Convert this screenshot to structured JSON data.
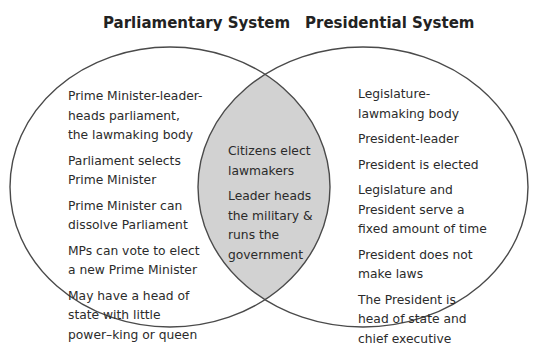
{
  "diagram": {
    "type": "venn",
    "colors": {
      "outline": "#4a4a4a",
      "intersection_fill": "#d2d2d2",
      "background": "#ffffff",
      "text": "#2b2b2b"
    },
    "left": {
      "title": "Parliamentary System",
      "items": [
        "Prime Minister-leader-heads parliament, the lawmaking body",
        "Parliament selects Prime Minister",
        "Prime Minister can dissolve Parliament",
        "MPs can vote to elect a new Prime Minister",
        "May have a head of state with little power–king or queen"
      ]
    },
    "center": {
      "items": [
        "Citizens elect lawmakers",
        "Leader heads the military & runs the government"
      ]
    },
    "right": {
      "title": "Presidential System",
      "items": [
        "Legislature-lawmaking body",
        "President-leader",
        "President is elected",
        "Legislature and President serve a fixed amount of time",
        "President does not make laws",
        "The President is head of state and chief executive"
      ]
    }
  }
}
